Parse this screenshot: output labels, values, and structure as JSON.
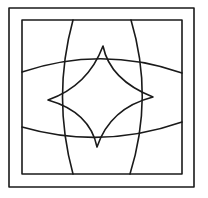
{
  "figure": {
    "colors": {
      "background": "#ffffff",
      "line": "#1a1a1a"
    },
    "outer_square": {
      "x1": 9,
      "y1": 8,
      "x2": 194,
      "y2": 187
    },
    "inner_square": {
      "x1": 22,
      "y1": 20,
      "x2": 182,
      "y2": 174
    },
    "star_points": {
      "top": [
        103,
        46
      ],
      "right": [
        153,
        97
      ],
      "bottom": [
        97,
        147
      ],
      "left": [
        48,
        100
      ]
    }
  }
}
